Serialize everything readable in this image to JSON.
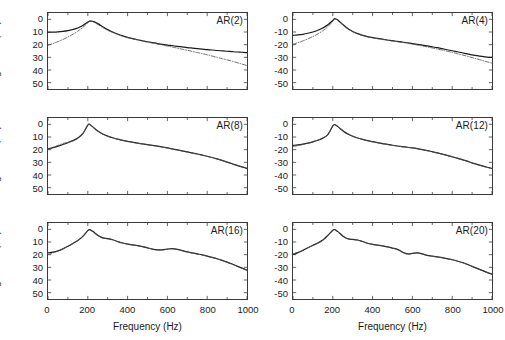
{
  "figure": {
    "width": 505,
    "height": 340,
    "background": "#ffffff",
    "axis_color": "#3a3a3a",
    "solid_color": "#1a1a1a",
    "dashdot_color": "#555555"
  },
  "axes": {
    "xlabel": "Frequency (Hz)",
    "ylabel_prefix": "Magnitude",
    "ylabel_sup": "2",
    "ylabel_suffix": " (dB)",
    "xticks": [
      0,
      200,
      400,
      600,
      800,
      1000
    ],
    "xtick_labels": [
      "0",
      "200",
      "400",
      "600",
      "800",
      "1000"
    ],
    "yticks": [
      0,
      -10,
      -20,
      -30,
      -40,
      -50
    ],
    "ytick_labels_left": [
      "0",
      "10",
      "20",
      "30",
      "40",
      "50"
    ],
    "ytick_labels_right": [
      "0",
      "-10",
      "-20",
      "-30",
      "-40",
      "-50"
    ],
    "xlim": [
      0,
      1000
    ],
    "ylim": [
      -55,
      5
    ],
    "grid": false,
    "legend": "none"
  },
  "chart_data": {
    "type": "line",
    "xlabel": "Frequency (Hz)",
    "ylabel": "Magnitude^2 (dB)",
    "xlim": [
      0,
      1000
    ],
    "ylim": [
      -55,
      5
    ],
    "xticks": [
      0,
      200,
      400,
      600,
      800,
      1000
    ],
    "yticks": [
      0,
      -10,
      -20,
      -30,
      -40,
      -50
    ],
    "grid": false,
    "legend": "none",
    "x": [
      0,
      25,
      50,
      75,
      100,
      125,
      150,
      175,
      200,
      210,
      225,
      250,
      275,
      300,
      325,
      350,
      375,
      400,
      425,
      450,
      475,
      500,
      525,
      550,
      575,
      600,
      625,
      650,
      675,
      700,
      725,
      750,
      775,
      800,
      825,
      850,
      875,
      900,
      925,
      950,
      975,
      1000
    ],
    "panels": [
      {
        "label": "AR(2)",
        "row": 0,
        "col": 0,
        "series": [
          {
            "name": "estimate",
            "style": "solid",
            "values": [
              -10.2,
              -10.1,
              -9.9,
              -9.5,
              -8.9,
              -8.0,
              -6.8,
              -4.9,
              -2.2,
              -1.4,
              -1.6,
              -3.4,
              -5.8,
              -8.1,
              -10.0,
              -11.6,
              -13.0,
              -14.2,
              -15.2,
              -16.1,
              -16.9,
              -17.7,
              -18.4,
              -19.1,
              -19.7,
              -20.3,
              -20.8,
              -21.3,
              -21.8,
              -22.3,
              -22.7,
              -23.1,
              -23.5,
              -23.9,
              -24.2,
              -24.6,
              -24.9,
              -25.2,
              -25.5,
              -25.8,
              -26.0,
              -26.3
            ]
          },
          {
            "name": "true-spectrum",
            "style": "dashdot",
            "values": [
              -20.4,
              -19.1,
              -17.6,
              -15.9,
              -14.0,
              -11.8,
              -9.3,
              -6.4,
              -2.6,
              -1.4,
              -1.8,
              -4.0,
              -6.4,
              -8.6,
              -10.4,
              -12.0,
              -13.3,
              -14.4,
              -15.4,
              -16.3,
              -17.1,
              -17.9,
              -18.7,
              -19.5,
              -20.3,
              -21.1,
              -21.9,
              -22.7,
              -23.6,
              -24.4,
              -25.3,
              -26.2,
              -27.1,
              -28.0,
              -29.0,
              -30.0,
              -31.0,
              -32.0,
              -33.1,
              -34.2,
              -35.3,
              -36.5
            ]
          }
        ]
      },
      {
        "label": "AR(4)",
        "row": 0,
        "col": 1,
        "series": [
          {
            "name": "estimate",
            "style": "solid",
            "values": [
              -12.6,
              -12.3,
              -11.8,
              -11.0,
              -10.0,
              -8.6,
              -6.8,
              -4.3,
              -0.9,
              0.5,
              -0.6,
              -4.0,
              -7.2,
              -9.6,
              -11.3,
              -12.6,
              -13.6,
              -14.4,
              -15.1,
              -15.7,
              -16.3,
              -16.8,
              -17.4,
              -17.9,
              -18.5,
              -19.1,
              -19.7,
              -20.3,
              -21.0,
              -21.7,
              -22.4,
              -23.2,
              -24.0,
              -24.8,
              -25.6,
              -26.4,
              -27.2,
              -28.0,
              -28.7,
              -29.3,
              -29.8,
              -30.1
            ]
          },
          {
            "name": "true-spectrum",
            "style": "dashdot",
            "values": [
              -19.6,
              -18.4,
              -17.0,
              -15.4,
              -13.6,
              -11.5,
              -9.0,
              -5.9,
              -1.6,
              0.4,
              -0.9,
              -4.4,
              -7.5,
              -9.8,
              -11.5,
              -12.8,
              -13.8,
              -14.6,
              -15.3,
              -15.9,
              -16.5,
              -17.1,
              -17.7,
              -18.3,
              -18.9,
              -19.6,
              -20.3,
              -21.0,
              -21.8,
              -22.6,
              -23.4,
              -24.3,
              -25.2,
              -26.1,
              -27.1,
              -28.1,
              -29.1,
              -30.2,
              -31.3,
              -32.4,
              -33.5,
              -34.6
            ]
          }
        ]
      },
      {
        "label": "AR(8)",
        "row": 1,
        "col": 0,
        "series": [
          {
            "name": "estimate",
            "style": "solid",
            "values": [
              -19.4,
              -18.4,
              -17.2,
              -15.9,
              -14.5,
              -12.9,
              -10.8,
              -7.4,
              -0.6,
              -0.2,
              -2.0,
              -5.2,
              -7.6,
              -9.3,
              -10.6,
              -11.7,
              -12.6,
              -13.4,
              -14.1,
              -14.8,
              -15.4,
              -16.0,
              -16.6,
              -17.2,
              -17.9,
              -18.6,
              -19.4,
              -20.2,
              -21.0,
              -21.8,
              -22.6,
              -23.4,
              -24.3,
              -25.2,
              -26.2,
              -27.3,
              -28.5,
              -29.8,
              -31.1,
              -32.4,
              -33.6,
              -34.8
            ]
          },
          {
            "name": "true-spectrum",
            "style": "dashdot",
            "values": [
              -19.8,
              -18.3,
              -16.6,
              -15.2,
              -14.1,
              -13.0,
              -10.9,
              -7.3,
              -0.5,
              -0.2,
              -2.1,
              -5.3,
              -7.7,
              -9.4,
              -10.7,
              -11.8,
              -12.7,
              -13.5,
              -14.2,
              -14.9,
              -15.5,
              -16.1,
              -16.7,
              -17.3,
              -18.0,
              -18.7,
              -19.5,
              -20.3,
              -21.1,
              -21.9,
              -22.7,
              -23.5,
              -24.4,
              -25.3,
              -26.3,
              -27.4,
              -28.6,
              -29.9,
              -31.2,
              -32.5,
              -33.7,
              -34.6
            ]
          }
        ]
      },
      {
        "label": "AR(12)",
        "row": 1,
        "col": 1,
        "series": [
          {
            "name": "estimate",
            "style": "solid",
            "values": [
              -16.6,
              -16.2,
              -15.6,
              -14.8,
              -13.8,
              -12.6,
              -10.9,
              -8.2,
              -1.2,
              -0.2,
              -1.8,
              -5.0,
              -7.6,
              -9.4,
              -10.8,
              -11.9,
              -12.9,
              -13.7,
              -14.5,
              -15.2,
              -15.9,
              -16.5,
              -17.1,
              -17.6,
              -18.1,
              -18.6,
              -19.2,
              -19.9,
              -20.7,
              -21.6,
              -22.5,
              -23.5,
              -24.5,
              -25.6,
              -26.7,
              -27.9,
              -29.1,
              -30.4,
              -31.6,
              -32.8,
              -33.9,
              -34.8
            ]
          },
          {
            "name": "true-spectrum",
            "style": "dashdot",
            "values": [
              -17.6,
              -16.8,
              -15.9,
              -14.9,
              -13.8,
              -12.5,
              -10.8,
              -8.1,
              -1.3,
              -0.3,
              -1.7,
              -4.7,
              -7.2,
              -9.2,
              -10.7,
              -11.9,
              -12.9,
              -13.8,
              -14.6,
              -15.3,
              -16.0,
              -16.6,
              -17.2,
              -17.7,
              -18.2,
              -18.7,
              -19.3,
              -20.0,
              -20.8,
              -21.7,
              -22.6,
              -23.6,
              -24.6,
              -25.7,
              -26.8,
              -28.0,
              -29.2,
              -30.5,
              -31.7,
              -32.9,
              -34.0,
              -34.9
            ]
          }
        ]
      },
      {
        "label": "AR(16)",
        "row": 2,
        "col": 0,
        "series": [
          {
            "name": "estimate",
            "style": "solid",
            "values": [
              -18.6,
              -18.0,
              -17.0,
              -15.4,
              -13.4,
              -11.2,
              -8.8,
              -5.6,
              -1.0,
              -0.3,
              -1.6,
              -4.6,
              -6.7,
              -7.4,
              -8.2,
              -9.6,
              -10.8,
              -11.6,
              -12.2,
              -12.8,
              -13.6,
              -14.6,
              -15.6,
              -16.2,
              -16.2,
              -15.6,
              -15.3,
              -15.8,
              -16.8,
              -17.8,
              -18.6,
              -19.4,
              -20.2,
              -21.1,
              -22.1,
              -23.2,
              -24.5,
              -25.9,
              -27.4,
              -29.0,
              -30.6,
              -32.2
            ]
          },
          {
            "name": "true-spectrum",
            "style": "dashdot",
            "values": [
              -19.8,
              -18.6,
              -17.2,
              -15.4,
              -13.4,
              -11.2,
              -8.8,
              -5.5,
              -0.9,
              -0.4,
              -1.8,
              -4.8,
              -6.8,
              -7.4,
              -8.2,
              -9.6,
              -10.8,
              -11.7,
              -12.3,
              -12.9,
              -13.7,
              -14.7,
              -15.7,
              -16.3,
              -16.3,
              -15.7,
              -15.4,
              -15.9,
              -16.9,
              -17.9,
              -18.7,
              -19.5,
              -20.3,
              -21.2,
              -22.2,
              -23.3,
              -24.6,
              -26.0,
              -27.5,
              -29.1,
              -30.7,
              -32.3
            ]
          }
        ]
      },
      {
        "label": "AR(20)",
        "row": 2,
        "col": 1,
        "series": [
          {
            "name": "estimate",
            "style": "solid",
            "values": [
              -19.8,
              -18.4,
              -16.6,
              -14.6,
              -12.6,
              -10.8,
              -8.4,
              -4.8,
              -0.7,
              -0.2,
              -1.8,
              -5.2,
              -7.4,
              -8.0,
              -8.4,
              -9.6,
              -11.0,
              -11.8,
              -12.4,
              -13.0,
              -13.8,
              -14.8,
              -15.8,
              -18.0,
              -19.4,
              -19.0,
              -18.6,
              -19.4,
              -20.6,
              -21.2,
              -21.8,
              -22.4,
              -23.2,
              -24.0,
              -25.0,
              -26.2,
              -27.6,
              -29.2,
              -30.8,
              -32.4,
              -34.0,
              -35.4
            ]
          },
          {
            "name": "true-spectrum",
            "style": "dashdot",
            "values": [
              -19.6,
              -18.2,
              -16.4,
              -14.5,
              -12.7,
              -11.0,
              -8.6,
              -4.9,
              -0.8,
              -0.3,
              -1.9,
              -5.3,
              -7.5,
              -8.1,
              -8.5,
              -9.7,
              -11.1,
              -11.9,
              -12.5,
              -13.1,
              -13.9,
              -14.9,
              -15.9,
              -18.1,
              -19.5,
              -19.1,
              -18.7,
              -19.5,
              -20.7,
              -21.3,
              -21.9,
              -22.5,
              -23.3,
              -24.1,
              -25.1,
              -26.3,
              -27.7,
              -29.3,
              -30.9,
              -32.5,
              -34.1,
              -35.5
            ]
          }
        ]
      }
    ]
  }
}
